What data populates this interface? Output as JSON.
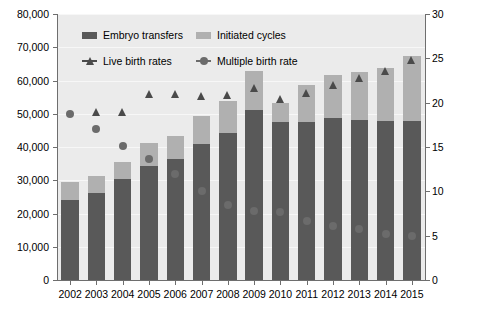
{
  "chart_data": {
    "type": "bar",
    "title": "",
    "subtitle": "",
    "xlabel": "",
    "ylabel": "",
    "ylabel_right": "",
    "categories": [
      "2002",
      "2003",
      "2004",
      "2005",
      "2006",
      "2007",
      "2008",
      "2009",
      "2010",
      "2011",
      "2012",
      "2013",
      "2014",
      "2015"
    ],
    "ylim": [
      0,
      80000
    ],
    "yticks": [
      0,
      10000,
      20000,
      30000,
      40000,
      50000,
      60000,
      70000,
      80000
    ],
    "ytick_labels": [
      "0",
      "10,000",
      "20,000",
      "30,000",
      "40,000",
      "50,000",
      "60,000",
      "70,000",
      "80,000"
    ],
    "ylim_right": [
      0,
      30
    ],
    "yticks_right": [
      0,
      5,
      10,
      15,
      20,
      25,
      30
    ],
    "ytick_labels_right": [
      "0",
      "5",
      "10",
      "15",
      "20",
      "25",
      "30"
    ],
    "grid": true,
    "legend_position": "top-inside",
    "stacked": true,
    "series": [
      {
        "name": "Embryo transfers",
        "axis": "left",
        "kind": "bar-stack-bottom",
        "color": "#595959",
        "values": [
          24000,
          26200,
          30300,
          34200,
          36400,
          40800,
          44300,
          51200,
          47600,
          47500,
          48800,
          48000,
          47900,
          47700
        ]
      },
      {
        "name": "Initiated cycles",
        "axis": "left",
        "kind": "bar-stack-top",
        "color": "#b0b0b0",
        "values": [
          29500,
          31400,
          35600,
          41200,
          43400,
          49300,
          53800,
          62800,
          53100,
          58600,
          61600,
          62600,
          63800,
          67400
        ]
      },
      {
        "name": "Live birth rates",
        "axis": "right",
        "kind": "marker-triangle",
        "color": "#4a4a4a",
        "values": [
          null,
          18.9,
          18.9,
          21.0,
          21.0,
          20.8,
          20.9,
          21.6,
          20.4,
          21.1,
          22.0,
          22.8,
          23.6,
          24.8
        ]
      },
      {
        "name": "Multiple birth rate",
        "axis": "right",
        "kind": "marker-circle",
        "color": "#6b6b6b",
        "values": [
          18.7,
          17.0,
          15.1,
          13.6,
          12.0,
          10.0,
          8.5,
          7.8,
          7.7,
          6.6,
          6.1,
          5.8,
          5.2,
          5.0
        ]
      }
    ]
  },
  "legend": {
    "items": [
      {
        "label": "Embryo transfers",
        "marker": "square-dark"
      },
      {
        "label": "Initiated cycles",
        "marker": "square-light"
      },
      {
        "label": "Live birth rates",
        "marker": "triangle"
      },
      {
        "label": "Multiple birth rate",
        "marker": "circle"
      }
    ]
  },
  "colors": {
    "bar_dark": "#595959",
    "bar_light": "#b0b0b0",
    "marker_triangle": "#4a4a4a",
    "marker_circle": "#6b6b6b",
    "plot_background": "#ebebeb",
    "axis": "#6e6e6e"
  }
}
